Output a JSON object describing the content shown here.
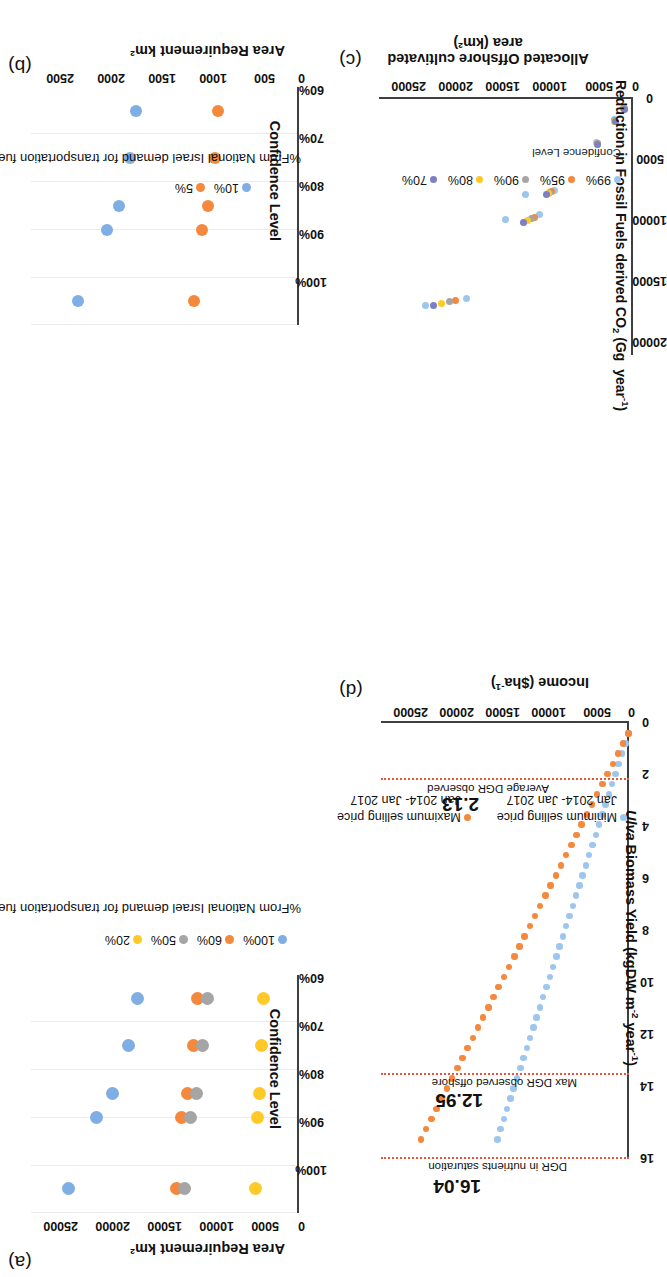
{
  "figure": {
    "panels": [
      "a",
      "b",
      "c",
      "d"
    ],
    "colors": {
      "blue": "#7EAEE4",
      "orange": "#F4883C",
      "gray": "#A5A5A5",
      "yellow": "#FFC927",
      "darkblue": "#7B7FC4",
      "dashed_red": "#E8553C",
      "axis": "#3F3F3F"
    }
  },
  "chart_data": [
    {
      "panel": "a",
      "label": "(a)",
      "type": "scatter",
      "title": "",
      "xlabel": "Confidence Level",
      "ylabel": "Area Requirement km²",
      "xtick_labels": [
        "60%",
        "70%",
        "80%",
        "90%",
        "100%"
      ],
      "ytick_labels": [
        "0",
        "5000",
        "10000",
        "15000",
        "20000",
        "25000"
      ],
      "ylim": [
        0,
        27000
      ],
      "grid": true,
      "legend_title": "%From National Israel demand for transportation fuel",
      "legend_position": "below",
      "categories": [
        "70%",
        "80%",
        "90%",
        "95%",
        "99%"
      ],
      "series": [
        {
          "name": "100%",
          "color": "#7EAEE4",
          "values": [
            16300,
            17200,
            18800,
            20400,
            23200
          ]
        },
        {
          "name": "60%",
          "color": "#F4883C",
          "values": [
            10200,
            10600,
            11200,
            11800,
            12300
          ]
        },
        {
          "name": "50%",
          "color": "#A5A5A5",
          "values": [
            9200,
            9700,
            10300,
            10900,
            11500
          ]
        },
        {
          "name": "20%",
          "color": "#FFC927",
          "values": [
            3600,
            3800,
            4000,
            4200,
            4400
          ]
        }
      ]
    },
    {
      "panel": "b",
      "label": "(b)",
      "type": "scatter",
      "title": "",
      "xlabel": "Confidence Level",
      "ylabel": "Area Requirement km²",
      "xtick_labels": [
        "60%",
        "70%",
        "80%",
        "90%",
        "100%"
      ],
      "ytick_labels": [
        "0",
        "500",
        "1000",
        "1500",
        "2000",
        "2500"
      ],
      "ylim": [
        0,
        2700
      ],
      "grid": true,
      "legend_title": "%From National Israel demand for transportation fuel",
      "legend_position": "below",
      "categories": [
        "70%",
        "80%",
        "90%",
        "95%",
        "99%"
      ],
      "series": [
        {
          "name": "10%",
          "color": "#7EAEE4",
          "values": [
            1640,
            1700,
            1810,
            1930,
            2230
          ]
        },
        {
          "name": "5%",
          "color": "#F4883C",
          "values": [
            820,
            850,
            920,
            980,
            1060
          ]
        }
      ]
    },
    {
      "panel": "c",
      "label": "(c)",
      "type": "scatter",
      "title": "",
      "xlabel": "Reduction in Fossil Fuels derived CO₂ (Gg  year⁻¹)",
      "ylabel": "Allocated Offshore cultivated area (km²)",
      "xtick_labels": [
        "0",
        "5000",
        "10000",
        "15000",
        "20000"
      ],
      "ytick_labels": [
        "0",
        "5000",
        "10000",
        "15000",
        "20000",
        "25000"
      ],
      "xlim": [
        0,
        21000
      ],
      "ylim": [
        0,
        26000
      ],
      "grid": false,
      "legend_title": "Confidence Level",
      "legend_position": "below",
      "series": [
        {
          "name": "99%",
          "color": "#9DC6EE",
          "points": [
            [
              700,
              940
            ],
            [
              1700,
              1930
            ],
            [
              3600,
              3700
            ],
            [
              7500,
              8000
            ],
            [
              7800,
              11000
            ],
            [
              9500,
              9600
            ],
            [
              9900,
              13100
            ],
            [
              16400,
              17000
            ],
            [
              16900,
              21200
            ]
          ]
        },
        {
          "name": "95%",
          "color": "#F4883C",
          "points": [
            [
              760,
              930
            ],
            [
              1750,
              1900
            ],
            [
              3650,
              3680
            ],
            [
              7600,
              8300
            ],
            [
              9700,
              10100
            ],
            [
              16550,
              18200
            ]
          ]
        },
        {
          "name": "90%",
          "color": "#A5A5A5",
          "points": [
            [
              790,
              920
            ],
            [
              1780,
              1880
            ],
            [
              3680,
              3660
            ],
            [
              7680,
              8500
            ],
            [
              9800,
              10400
            ],
            [
              16650,
              18800
            ]
          ]
        },
        {
          "name": "80%",
          "color": "#FFC927",
          "points": [
            [
              820,
              910
            ],
            [
              1810,
              1860
            ],
            [
              3700,
              3640
            ],
            [
              7750,
              8700
            ],
            [
              9950,
              10800
            ],
            [
              16800,
              19600
            ]
          ]
        },
        {
          "name": "70%",
          "color": "#7B7FC4",
          "points": [
            [
              850,
              900
            ],
            [
              1840,
              1840
            ],
            [
              3730,
              3620
            ],
            [
              7850,
              8900
            ],
            [
              10100,
              11200
            ],
            [
              16950,
              20400
            ]
          ]
        }
      ]
    },
    {
      "panel": "d",
      "label": "(d)",
      "type": "scatter",
      "title": "",
      "xlabel_html": "<i>Ulva</i> Biomass Yield (kgDW m<sup>-2</sup> year<sup>-1</sup>)",
      "xlabel": "Ulva Biomass Yield (kgDW m-2 year-1)",
      "ylabel": "Income ($ha⁻¹)",
      "xtick_labels": [
        "0",
        "2",
        "4",
        "6",
        "8",
        "10",
        "12",
        "14",
        "16"
      ],
      "ytick_labels": [
        "0",
        "5000",
        "10000",
        "15000",
        "20000",
        "25000"
      ],
      "xlim": [
        0,
        16.8
      ],
      "ylim": [
        0,
        26000
      ],
      "grid": false,
      "markers": [
        {
          "x": 2.13,
          "value_label": "2.13",
          "text": "Average DGR observed"
        },
        {
          "x": 12.95,
          "value_label": "12.95",
          "text": "Max DGR observed offshore"
        },
        {
          "x": 16.04,
          "value_label": "16.04",
          "text": "DGR in nutrients saturation"
        }
      ],
      "legend_position": "below",
      "series": [
        {
          "name": "Minimum selling price",
          "sublabel": "Jan 2014- Jan 2017",
          "color": "#9DC6EE",
          "slope": 880,
          "x_start": 0.4,
          "x_end": 16.04,
          "n_points": 40
        },
        {
          "name": "Maximum selling price",
          "sublabel": "Jan 2014- Jan 2017",
          "color": "#F4883C",
          "slope": 1390,
          "x_start": 0.4,
          "x_end": 16.04,
          "n_points": 40
        }
      ]
    }
  ]
}
